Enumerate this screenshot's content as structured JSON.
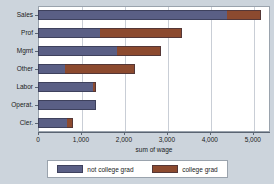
{
  "chart_data": {
    "type": "bar",
    "orientation": "horizontal",
    "stacked": true,
    "title": "",
    "xlabel": "sum of wage",
    "ylabel": "",
    "xlim": [
      0,
      5400
    ],
    "xticks": [
      0,
      1000,
      2000,
      3000,
      4000,
      5000
    ],
    "xtick_labels": [
      "0",
      "1,000",
      "2,000",
      "3,000",
      "4,000",
      "5,000"
    ],
    "grid": true,
    "grid_axis": "x",
    "legend_position": "bottom",
    "categories": [
      "Sales",
      "Prof",
      "Mgmt",
      "Other",
      "Labor",
      "Operat.",
      "Cler."
    ],
    "series": [
      {
        "name": "not college grad",
        "color": "#5a5f85",
        "values": [
          4400,
          1450,
          1830,
          630,
          1270,
          1340,
          670
        ]
      },
      {
        "name": "college grad",
        "color": "#8c4a2f",
        "values": [
          800,
          1900,
          1030,
          1630,
          90,
          0,
          140
        ]
      }
    ],
    "totals": [
      5200,
      3350,
      2860,
      2260,
      1360,
      1340,
      810
    ]
  },
  "legend": {
    "items": [
      {
        "label": "not college grad",
        "color": "#5a5f85"
      },
      {
        "label": "college grad",
        "color": "#8c4a2f"
      }
    ]
  },
  "colors": {
    "background": "#ccd4dc",
    "plot_background": "#ffffff",
    "axis": "#5a6472",
    "gridline": "#c9ced6",
    "not_college_grad": "#5a5f85",
    "college_grad": "#8c4a2f"
  }
}
